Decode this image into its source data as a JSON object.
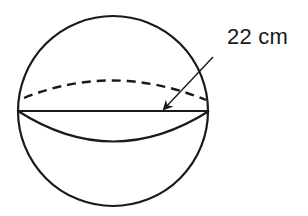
{
  "diagram": {
    "type": "sphere",
    "shape_label": "sphere",
    "measurement": {
      "label": "22 cm",
      "refers_to": "diameter"
    },
    "colors": {
      "stroke": "#1a1a1a",
      "background": "#ffffff"
    }
  }
}
